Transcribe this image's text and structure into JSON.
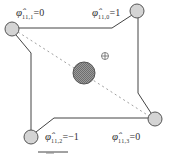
{
  "diagram": {
    "center_marker_symbol": "⊕",
    "nodes": [
      {
        "id": "top-left",
        "symbol": "φ̂",
        "subscript": "11,1",
        "value": "=0",
        "cx": 12,
        "cy": 29
      },
      {
        "id": "top-right",
        "symbol": "φ̂",
        "subscript": "11,0",
        "value": "=1",
        "cx": 137,
        "cy": 11
      },
      {
        "id": "bottom-left",
        "symbol": "φ̂",
        "subscript": "11,2",
        "value": "=−1",
        "cx": 31,
        "cy": 137
      },
      {
        "id": "bottom-right",
        "symbol": "φ̂",
        "subscript": "11,3",
        "value": "=0",
        "cx": 155,
        "cy": 119
      }
    ],
    "center_circle": {
      "cx": 84,
      "cy": 73,
      "r": 11,
      "fill": "#8a8a8a"
    },
    "colors": {
      "node_fill": "#d4d4d4",
      "node_stroke": "#555555",
      "edge": "#444444",
      "dashed": "#999999"
    }
  }
}
